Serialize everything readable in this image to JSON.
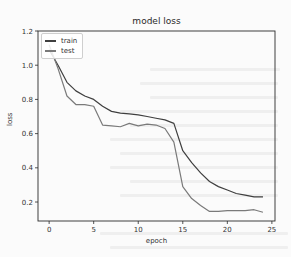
{
  "chart_data": {
    "type": "line",
    "title": "model loss",
    "xlabel": "epoch",
    "ylabel": "loss",
    "xlim": [
      -1.25,
      25.35
    ],
    "ylim": [
      0.089,
      1.2
    ],
    "xticks": [
      0,
      5,
      10,
      15,
      20,
      25
    ],
    "yticks": [
      0.2,
      0.4,
      0.6,
      0.8,
      1.0,
      1.2
    ],
    "xtick_labels": [
      "0",
      "5",
      "10",
      "15",
      "20",
      "25"
    ],
    "ytick_labels": [
      "0.2",
      "0.4",
      "0.6",
      "0.8",
      "1.0",
      "1.2"
    ],
    "grid": false,
    "legend_position": "upper left",
    "x": [
      0,
      1,
      2,
      3,
      4,
      5,
      6,
      7,
      8,
      9,
      10,
      11,
      12,
      13,
      14,
      15,
      16,
      17,
      18,
      19,
      20,
      21,
      22,
      23,
      24
    ],
    "series": [
      {
        "name": "train",
        "color": "#3f3f3f",
        "values": [
          1.09,
          1.0,
          0.9,
          0.85,
          0.82,
          0.8,
          0.76,
          0.73,
          0.72,
          0.715,
          0.71,
          0.7,
          0.69,
          0.68,
          0.66,
          0.5,
          0.43,
          0.37,
          0.32,
          0.29,
          0.27,
          0.25,
          0.24,
          0.23,
          0.23
        ]
      },
      {
        "name": "test",
        "color": "#7a7a7a",
        "values": [
          1.12,
          0.98,
          0.82,
          0.77,
          0.77,
          0.76,
          0.65,
          0.645,
          0.64,
          0.66,
          0.645,
          0.655,
          0.65,
          0.63,
          0.55,
          0.29,
          0.22,
          0.18,
          0.145,
          0.145,
          0.15,
          0.15,
          0.15,
          0.155,
          0.14
        ]
      }
    ]
  },
  "legend": {
    "items": [
      {
        "label": "train",
        "color": "#3f3f3f"
      },
      {
        "label": "test",
        "color": "#7a7a7a"
      }
    ]
  },
  "colors": {
    "axes": "#2a2a2a",
    "tick_text": "#333333",
    "background": "#fbfbfb"
  }
}
